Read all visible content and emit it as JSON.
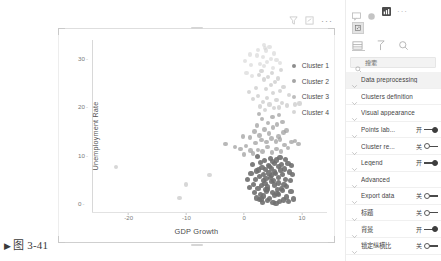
{
  "caption": {
    "marker": "▶",
    "text": "图 3-41"
  },
  "chart_toolbar": {
    "filter_icon": "filter-icon",
    "focus_icon": "focus-mode-icon",
    "more_label": "···"
  },
  "chart_data": {
    "type": "scatter",
    "title": "",
    "xlabel": "GDP Growth",
    "ylabel": "Unemployment Rate",
    "xlim": [
      -26,
      14
    ],
    "ylim": [
      -1.5,
      34
    ],
    "xticks": [
      -20,
      -10,
      0,
      10
    ],
    "xticklabels": [
      "-20",
      "-10",
      "0",
      "10"
    ],
    "yticks": [
      0,
      10,
      20,
      30
    ],
    "yticklabels": [
      "0",
      "10",
      "20",
      "30"
    ],
    "grid": false,
    "legend_position": "right",
    "legend": [
      "Cluster 1",
      "Cluster 2",
      "Cluster 3",
      "Cluster 4"
    ],
    "colors": [
      "#8d8d8d",
      "#a5a5a5",
      "#bdbdbd",
      "#d6d6d6"
    ],
    "series": [
      {
        "name": "Cluster 1",
        "color": "#6f6f6f",
        "points": [
          [
            2.1,
            1.2
          ],
          [
            2.8,
            2.0
          ],
          [
            3.4,
            1.6
          ],
          [
            3.9,
            2.6
          ],
          [
            4.4,
            1.1
          ],
          [
            4.9,
            2.3
          ],
          [
            5.3,
            1.8
          ],
          [
            5.8,
            3.0
          ],
          [
            2.4,
            3.2
          ],
          [
            3.0,
            3.8
          ],
          [
            3.6,
            4.2
          ],
          [
            4.1,
            3.5
          ],
          [
            4.7,
            4.6
          ],
          [
            5.2,
            3.9
          ],
          [
            5.9,
            4.3
          ],
          [
            6.4,
            3.1
          ],
          [
            2.0,
            5.0
          ],
          [
            2.7,
            5.6
          ],
          [
            3.3,
            6.0
          ],
          [
            3.8,
            5.2
          ],
          [
            4.3,
            6.4
          ],
          [
            4.8,
            5.8
          ],
          [
            5.4,
            6.2
          ],
          [
            6.0,
            5.4
          ],
          [
            6.6,
            6.0
          ],
          [
            7.1,
            5.1
          ],
          [
            2.5,
            7.0
          ],
          [
            3.1,
            7.6
          ],
          [
            3.7,
            7.1
          ],
          [
            4.2,
            8.0
          ],
          [
            4.8,
            7.4
          ],
          [
            5.3,
            8.3
          ],
          [
            5.9,
            7.8
          ],
          [
            6.5,
            8.1
          ],
          [
            7.0,
            7.2
          ],
          [
            7.6,
            8.4
          ],
          [
            1.6,
            4.0
          ],
          [
            1.2,
            6.2
          ],
          [
            1.8,
            2.4
          ],
          [
            0.9,
            3.4
          ],
          [
            8.0,
            4.8
          ],
          [
            8.4,
            6.0
          ],
          [
            8.1,
            2.6
          ],
          [
            7.4,
            1.4
          ],
          [
            6.8,
            0.8
          ],
          [
            6.1,
            0.5
          ],
          [
            5.0,
            0.3
          ],
          [
            4.0,
            0.6
          ],
          [
            3.2,
            0.2
          ],
          [
            2.6,
            0.9
          ],
          [
            3.5,
            9.0
          ],
          [
            4.6,
            9.4
          ],
          [
            5.6,
            9.1
          ],
          [
            6.2,
            9.6
          ],
          [
            7.2,
            9.2
          ],
          [
            2.9,
            8.6
          ],
          [
            4.1,
            2.9
          ],
          [
            5.1,
            4.9
          ],
          [
            6.3,
            7.0
          ],
          [
            7.8,
            6.6
          ],
          [
            3.0,
            1.0
          ],
          [
            4.5,
            5.5
          ],
          [
            5.7,
            2.2
          ],
          [
            6.9,
            4.0
          ],
          [
            2.2,
            6.8
          ],
          [
            3.8,
            3.0
          ],
          [
            4.9,
            8.8
          ],
          [
            6.0,
            1.9
          ],
          [
            7.3,
            3.6
          ],
          [
            8.2,
            8.0
          ],
          [
            1.4,
            8.2
          ],
          [
            0.6,
            5.0
          ],
          [
            5.5,
            0.0
          ],
          [
            7.7,
            0.4
          ],
          [
            8.6,
            1.0
          ],
          [
            2.3,
            9.8
          ],
          [
            6.7,
            2.8
          ],
          [
            3.3,
            4.8
          ],
          [
            4.4,
            7.8
          ],
          [
            5.2,
            6.6
          ]
        ]
      },
      {
        "name": "Cluster 2",
        "color": "#a0a0a0",
        "points": [
          [
            1.5,
            10.4
          ],
          [
            2.4,
            11.2
          ],
          [
            3.2,
            10.8
          ],
          [
            4.0,
            11.8
          ],
          [
            4.8,
            10.6
          ],
          [
            5.6,
            11.4
          ],
          [
            6.4,
            10.9
          ],
          [
            2.0,
            12.6
          ],
          [
            3.0,
            13.2
          ],
          [
            3.9,
            12.8
          ],
          [
            4.7,
            13.6
          ],
          [
            5.5,
            12.9
          ],
          [
            6.2,
            13.4
          ],
          [
            7.0,
            12.2
          ],
          [
            1.1,
            11.0
          ],
          [
            0.3,
            12.0
          ],
          [
            -0.6,
            11.4
          ],
          [
            7.6,
            11.6
          ],
          [
            8.2,
            12.8
          ],
          [
            2.7,
            14.2
          ],
          [
            4.3,
            14.6
          ],
          [
            5.9,
            14.0
          ],
          [
            6.8,
            14.8
          ],
          [
            3.5,
            15.4
          ],
          [
            5.0,
            15.8
          ],
          [
            1.8,
            15.0
          ],
          [
            7.3,
            15.2
          ],
          [
            2.2,
            16.2
          ],
          [
            4.1,
            16.8
          ],
          [
            5.7,
            16.4
          ],
          [
            6.6,
            17.0
          ],
          [
            3.1,
            17.6
          ],
          [
            4.9,
            18.0
          ],
          [
            2.6,
            18.6
          ],
          [
            6.0,
            18.4
          ],
          [
            -1.6,
            11.8
          ],
          [
            -3.2,
            12.4
          ],
          [
            0.0,
            10.2
          ],
          [
            -0.2,
            14.0
          ],
          [
            8.8,
            13.0
          ],
          [
            9.4,
            12.4
          ],
          [
            1.0,
            13.8
          ]
        ]
      },
      {
        "name": "Cluster 3",
        "color": "#bcbcbc",
        "points": [
          [
            3.6,
            19.4
          ],
          [
            5.1,
            19.8
          ],
          [
            2.8,
            20.2
          ],
          [
            4.4,
            20.6
          ],
          [
            6.0,
            20.0
          ],
          [
            3.2,
            21.2
          ],
          [
            5.6,
            21.6
          ],
          [
            4.0,
            22.0
          ],
          [
            6.6,
            21.0
          ],
          [
            2.4,
            22.4
          ],
          [
            7.4,
            20.4
          ],
          [
            8.8,
            20.6
          ],
          [
            9.6,
            20.8
          ],
          [
            5.0,
            23.0
          ],
          [
            3.8,
            23.8
          ],
          [
            6.2,
            23.4
          ],
          [
            4.6,
            24.6
          ],
          [
            2.0,
            24.0
          ],
          [
            5.4,
            25.2
          ],
          [
            3.4,
            25.8
          ],
          [
            6.8,
            24.2
          ],
          [
            4.2,
            26.4
          ],
          [
            2.6,
            26.8
          ],
          [
            5.8,
            26.0
          ],
          [
            3.0,
            27.6
          ],
          [
            4.8,
            27.2
          ],
          [
            6.4,
            27.8
          ],
          [
            1.6,
            21.8
          ],
          [
            0.8,
            23.2
          ],
          [
            7.8,
            22.6
          ],
          [
            -22.2,
            7.6
          ],
          [
            -10.0,
            4.0
          ],
          [
            -11.2,
            1.2
          ],
          [
            -6.0,
            6.0
          ]
        ]
      },
      {
        "name": "Cluster 4",
        "color": "#d2d2d2",
        "points": [
          [
            3.4,
            28.6
          ],
          [
            5.0,
            28.2
          ],
          [
            4.0,
            29.4
          ],
          [
            2.8,
            29.0
          ],
          [
            5.6,
            29.8
          ],
          [
            1.2,
            28.8
          ],
          [
            3.2,
            30.4
          ],
          [
            4.6,
            30.0
          ],
          [
            2.2,
            30.8
          ],
          [
            5.2,
            31.2
          ],
          [
            3.8,
            31.8
          ],
          [
            1.0,
            31.0
          ],
          [
            3.6,
            32.4
          ],
          [
            3.5,
            32.9
          ],
          [
            1.4,
            26.6
          ],
          [
            0.4,
            27.2
          ],
          [
            6.2,
            29.2
          ],
          [
            2.4,
            32.0
          ],
          [
            4.4,
            32.6
          ],
          [
            0.2,
            29.6
          ]
        ]
      }
    ]
  },
  "pane": {
    "top_icons": [
      "comment-icon",
      "sync-icon",
      "visualizations-icon"
    ],
    "top_more": "···",
    "badge_icon": "visual-thumbnail-icon",
    "tabs": [
      {
        "name": "fields-tab",
        "icon": "fields-icon"
      },
      {
        "name": "format-tab",
        "icon": "paintbrush-icon"
      },
      {
        "name": "analytics-tab",
        "icon": "magnifier-analytics-icon"
      }
    ],
    "search": {
      "icon": "search-icon",
      "placeholder": "搜索",
      "value": ""
    },
    "rows": [
      {
        "label": "Data preprocessing",
        "toggle": null,
        "highlight": true
      },
      {
        "label": "Clusters definition",
        "toggle": null,
        "highlight": false
      },
      {
        "label": "Visual appearance",
        "toggle": null,
        "highlight": false
      },
      {
        "label": "Points lab...",
        "toggle": "on",
        "state": "开",
        "highlight": false
      },
      {
        "label": "Cluster re...",
        "toggle": "off",
        "state": "关",
        "highlight": false
      },
      {
        "label": "Legend",
        "toggle": "on",
        "state": "开",
        "highlight": false
      },
      {
        "label": "Advanced",
        "toggle": null,
        "highlight": false
      },
      {
        "label": "Export data",
        "toggle": "off",
        "state": "关",
        "highlight": false
      },
      {
        "label": "标题",
        "toggle": "off",
        "state": "关",
        "highlight": false
      },
      {
        "label": "背景",
        "toggle": "on",
        "state": "开",
        "highlight": false
      },
      {
        "label": "锁定纵横比",
        "toggle": "off",
        "state": "关",
        "highlight": false
      }
    ]
  }
}
